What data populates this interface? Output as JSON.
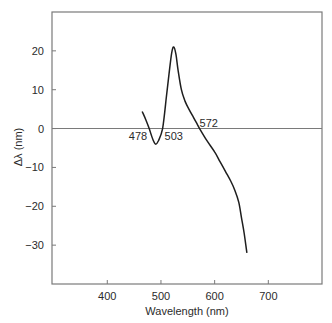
{
  "chart_data": {
    "type": "line",
    "title": "",
    "xlabel": "Wavelength (nm)",
    "ylabel": "Δλ (nm)",
    "xlim": [
      297,
      800
    ],
    "ylim": [
      -40,
      30
    ],
    "xticks": [
      400,
      500,
      600,
      700
    ],
    "xtick_labels": [
      "400",
      "500",
      "600",
      "700"
    ],
    "yticks": [
      20,
      10,
      0,
      -10,
      -20,
      -30
    ],
    "ytick_labels": [
      "20",
      "10",
      "0",
      "−10",
      "−20",
      "−30"
    ],
    "grid": false,
    "legend": null,
    "zero_line": true,
    "series": [
      {
        "name": "Δλ",
        "x": [
          465,
          472,
          478,
          485,
          490,
          495,
          503,
          510,
          515,
          520,
          524,
          528,
          532,
          538,
          545,
          552,
          560,
          566,
          572,
          585,
          600,
          610,
          620,
          630,
          638,
          645,
          650,
          655,
          660
        ],
        "y": [
          4.4,
          2.2,
          0,
          -2.8,
          -4.0,
          -3.2,
          0,
          8,
          14,
          19.5,
          21,
          19,
          15,
          10,
          7,
          5,
          3,
          1.5,
          0,
          -3,
          -6,
          -8.5,
          -11,
          -13.5,
          -16,
          -19,
          -23,
          -27,
          -32
        ]
      }
    ],
    "annotations": [
      {
        "text": "478",
        "x": 478,
        "y": 0,
        "position": "below-left"
      },
      {
        "text": "503",
        "x": 503,
        "y": 0,
        "position": "below-right"
      },
      {
        "text": "572",
        "x": 572,
        "y": 0,
        "position": "above-right"
      }
    ]
  },
  "colors": {
    "frame": "#7a7a7a",
    "curve": "#1e1e1e",
    "text": "#2b2b2b",
    "background": "#ffffff"
  }
}
